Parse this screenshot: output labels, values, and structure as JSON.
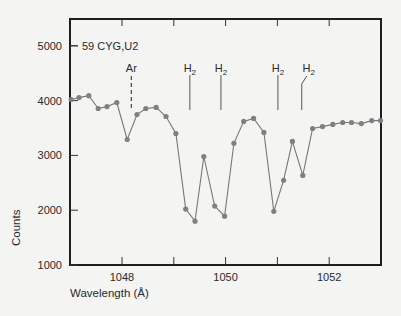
{
  "chart_data": {
    "type": "line",
    "title": "59 CYG,U2",
    "xlabel": "Wavelength (Å)",
    "ylabel": "Counts",
    "xlim": [
      1047.0,
      1053.0
    ],
    "ylim": [
      1000,
      5500
    ],
    "grid": false,
    "legend": null,
    "x_ticks": [
      1048,
      1049,
      1050,
      1051,
      1052
    ],
    "x_tick_labels": [
      "1048",
      "",
      "1050",
      "",
      "1052"
    ],
    "y_ticks": [
      1000,
      2000,
      3000,
      4000,
      5000
    ],
    "y_tick_labels": [
      "1000",
      "2000",
      "3000",
      "4000",
      "5000"
    ],
    "series": [
      {
        "name": "59 CYG,U2",
        "color": "#777777",
        "marker": "circle",
        "x": [
          1047.02,
          1047.17,
          1047.36,
          1047.54,
          1047.71,
          1047.9,
          1048.1,
          1048.29,
          1048.46,
          1048.66,
          1048.85,
          1049.04,
          1049.23,
          1049.41,
          1049.58,
          1049.79,
          1049.98,
          1050.16,
          1050.35,
          1050.54,
          1050.74,
          1050.93,
          1051.12,
          1051.29,
          1051.49,
          1051.68,
          1051.87,
          1052.07,
          1052.26,
          1052.43,
          1052.62,
          1052.82,
          1052.99
        ],
        "values": [
          4020,
          4055,
          4090,
          3855,
          3890,
          3965,
          3290,
          3745,
          3855,
          3875,
          3710,
          3400,
          2020,
          1800,
          2980,
          2075,
          1890,
          3220,
          3620,
          3675,
          3420,
          1980,
          2545,
          3255,
          2635,
          3490,
          3525,
          3565,
          3600,
          3600,
          3580,
          3635,
          3635
        ]
      }
    ],
    "annotations": [
      {
        "label": "Ar",
        "x": 1048.18,
        "style": "dashed"
      },
      {
        "label": "H₂",
        "x": 1049.31,
        "style": "solid"
      },
      {
        "label": "H₂",
        "x": 1049.91,
        "style": "solid"
      },
      {
        "label": "H₂",
        "x": 1051.01,
        "style": "solid"
      },
      {
        "label": "H₂",
        "x": 1051.47,
        "style": "solid-bent"
      }
    ]
  },
  "labels": {
    "series_label": "59 CYG,U2",
    "xlabel": "Wavelength (Å)",
    "ylabel": "Counts",
    "ar": "Ar",
    "h2": "H",
    "h2_sub": "2"
  }
}
